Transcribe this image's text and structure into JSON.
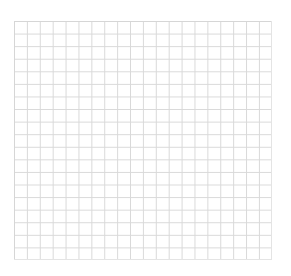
{
  "grid": {
    "columns": 20,
    "rows": 19,
    "line_color": "#d9d9d9",
    "background_color": "#ffffff"
  }
}
